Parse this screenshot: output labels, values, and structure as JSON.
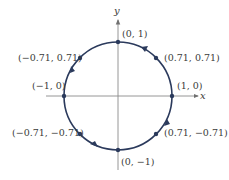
{
  "diagram": {
    "axes": {
      "x_label": "x",
      "y_label": "y"
    },
    "circle": {
      "radius": 1,
      "color": "#2b3a5c",
      "direction": "counterclockwise"
    },
    "points": [
      {
        "label": "(0, 1)",
        "x": 0,
        "y": 1
      },
      {
        "label": "(0.71, 0.71)",
        "x": 0.71,
        "y": 0.71
      },
      {
        "label": "(−0.71, 0.71)",
        "x": -0.71,
        "y": 0.71
      },
      {
        "label": "(−1, 0)",
        "x": -1,
        "y": 0
      },
      {
        "label": "(1, 0)",
        "x": 1,
        "y": 0
      },
      {
        "label": "(−0.71, −0.71)",
        "x": -0.71,
        "y": -0.71
      },
      {
        "label": "(0.71, −0.71)",
        "x": 0.71,
        "y": -0.71
      },
      {
        "label": "(0, −1)",
        "x": 0,
        "y": -1
      }
    ],
    "colors": {
      "circle": "#2b3a5c",
      "axis": "#808080",
      "text": "#3a3a3a"
    }
  }
}
